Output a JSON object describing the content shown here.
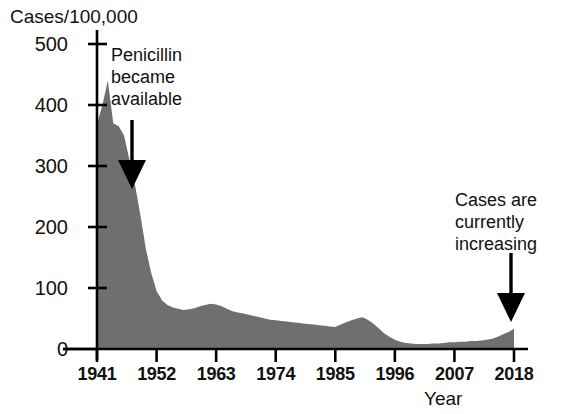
{
  "chart_data": {
    "type": "area",
    "title": "",
    "ylabel": "Cases/100,000",
    "xlabel": "Year",
    "xlim": [
      1941,
      2018
    ],
    "ylim": [
      0,
      500
    ],
    "y_ticks": [
      0,
      100,
      200,
      300,
      400,
      500
    ],
    "y_tick_labels": [
      "0",
      "100",
      "200",
      "300",
      "400",
      "500"
    ],
    "x_ticks": [
      1941,
      1952,
      1963,
      1974,
      1985,
      1996,
      2007,
      2018
    ],
    "x_tick_labels": [
      "1941",
      "1952",
      "1963",
      "1974",
      "1985",
      "1996",
      "2007",
      "2018"
    ],
    "grid": false,
    "legend": "none",
    "fill_color": "#6f6f6f",
    "axis_color": "#000000",
    "series": [
      {
        "name": "Syphilis cases per 100,000",
        "x": [
          1941,
          1942,
          1943,
          1944,
          1945,
          1946,
          1947,
          1948,
          1949,
          1950,
          1951,
          1952,
          1953,
          1954,
          1955,
          1956,
          1957,
          1958,
          1959,
          1960,
          1961,
          1962,
          1963,
          1964,
          1965,
          1966,
          1967,
          1968,
          1969,
          1970,
          1971,
          1972,
          1973,
          1974,
          1975,
          1976,
          1977,
          1978,
          1979,
          1980,
          1981,
          1982,
          1983,
          1984,
          1985,
          1986,
          1987,
          1988,
          1989,
          1990,
          1991,
          1992,
          1993,
          1994,
          1995,
          1996,
          1997,
          1998,
          1999,
          2000,
          2001,
          2002,
          2003,
          2004,
          2005,
          2006,
          2007,
          2008,
          2009,
          2010,
          2011,
          2012,
          2013,
          2014,
          2015,
          2016,
          2017,
          2018
        ],
        "y": [
          368,
          400,
          440,
          370,
          365,
          350,
          310,
          270,
          220,
          165,
          125,
          95,
          80,
          72,
          68,
          66,
          64,
          65,
          67,
          70,
          72,
          74,
          73,
          70,
          66,
          62,
          60,
          58,
          56,
          54,
          52,
          50,
          48,
          47,
          46,
          45,
          44,
          43,
          42,
          41,
          40,
          39,
          38,
          37,
          36,
          40,
          44,
          47,
          50,
          52,
          48,
          42,
          34,
          26,
          20,
          15,
          12,
          10,
          9,
          8,
          8,
          8,
          9,
          9,
          10,
          11,
          11,
          12,
          12,
          13,
          13,
          14,
          15,
          17,
          20,
          24,
          28,
          33
        ]
      }
    ],
    "annotations": [
      {
        "id": "penicillin",
        "text": "Penicillin\nbecame\navailable",
        "arrow": "down",
        "points_at_year": 1947
      },
      {
        "id": "increasing",
        "text": "Cases are\ncurrently\nincreasing",
        "arrow": "down",
        "points_at_year": 2018
      }
    ]
  },
  "axis": {
    "y_title": "Cases/100,000",
    "x_title": "Year"
  },
  "annotations": {
    "penicillin": "Penicillin\nbecame\navailable",
    "increasing": "Cases are\ncurrently\nincreasing"
  }
}
